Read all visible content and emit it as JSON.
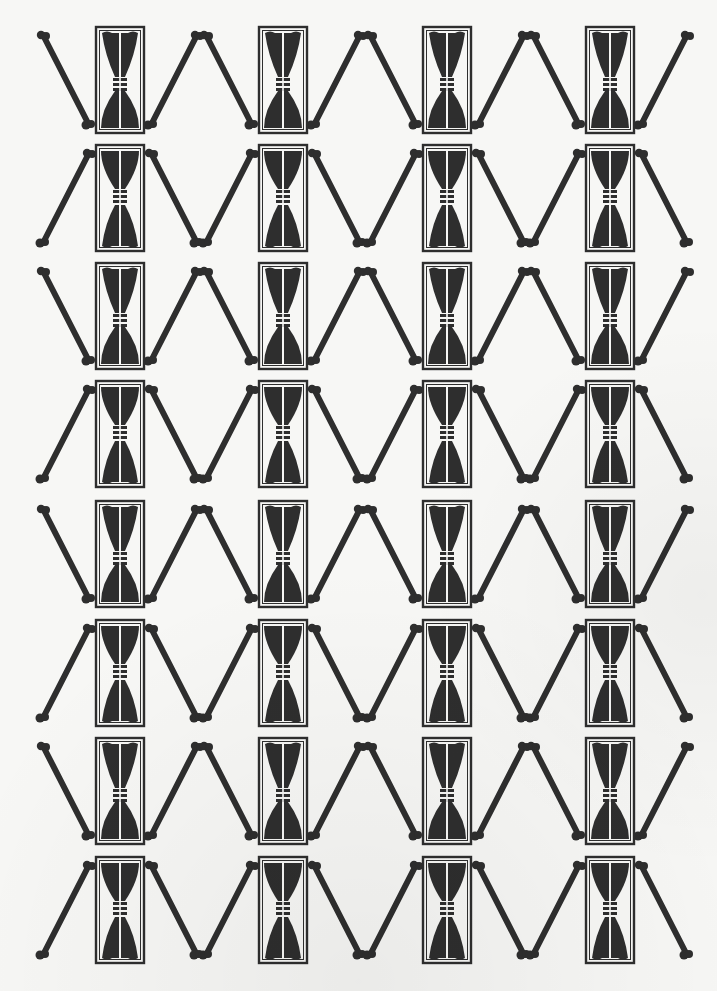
{
  "artwork": {
    "type": "repeating-print-pattern",
    "motif": "hourglass-in-frame-with-crossed-bones",
    "columns": 4,
    "rows": 8,
    "column_centers_x": [
      120,
      283,
      447,
      610
    ],
    "row_tops_y": [
      27,
      145,
      263,
      381,
      501,
      620,
      738,
      857
    ],
    "row_orientation": [
      "down",
      "up",
      "down",
      "up",
      "down",
      "up",
      "down",
      "up"
    ],
    "colors": {
      "ink": "#2e2e2e",
      "paper": "#f7f7f5"
    }
  }
}
